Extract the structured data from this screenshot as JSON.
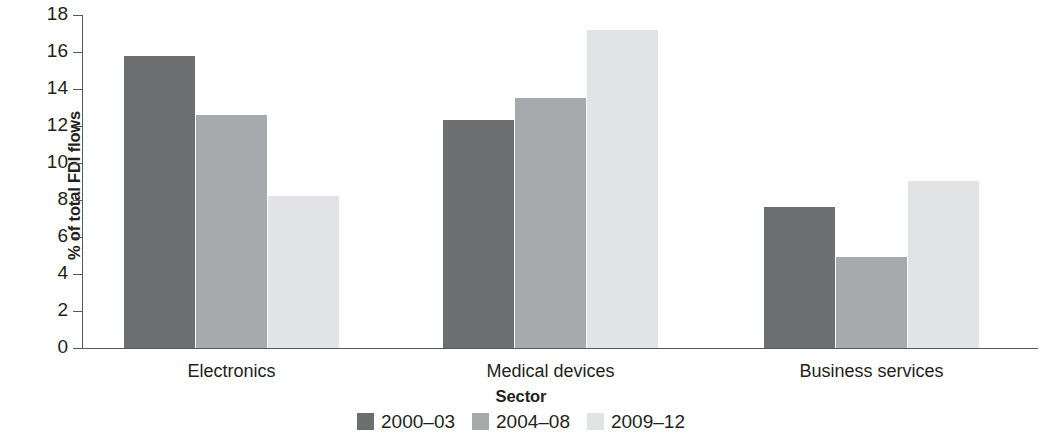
{
  "chart_data": {
    "type": "bar",
    "title": "",
    "xlabel": "Sector",
    "ylabel": "% of total FDI flows",
    "categories": [
      "Electronics",
      "Medical devices",
      "Business services"
    ],
    "series": [
      {
        "name": "2000–03",
        "color": "#6d6e70",
        "values": [
          15.8,
          12.3,
          7.6
        ]
      },
      {
        "name": "2004–08",
        "color": "#a7a9ac",
        "values": [
          12.6,
          13.5,
          4.9
        ]
      },
      {
        "name": "2009–12",
        "color": "#e2e3e4",
        "values": [
          8.2,
          17.2,
          9.05
        ]
      }
    ],
    "ylim": [
      0,
      18
    ],
    "ytick_step": 2,
    "yticks": [
      "0",
      "2",
      "4",
      "6",
      "8",
      "10",
      "12",
      "14",
      "16",
      "18"
    ],
    "grid": false,
    "legend_position": "bottom"
  },
  "axis": {
    "line_color": "#58595b"
  }
}
